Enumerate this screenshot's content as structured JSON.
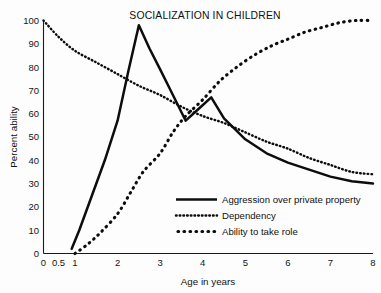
{
  "chart_data": {
    "type": "line",
    "title": "SOCIALIZATION IN CHILDREN",
    "xlabel": "Age in years",
    "ylabel": "Percent ability",
    "xlim": [
      0,
      8
    ],
    "ylim": [
      0,
      100
    ],
    "grid": false,
    "legend_position": "inside lower-right",
    "x_tick_labels": [
      "0",
      "0.5",
      "1",
      "2",
      "3",
      "4",
      "5",
      "6",
      "7",
      "8"
    ],
    "x_tick_values": [
      0,
      0.5,
      1,
      2,
      3,
      4,
      5,
      6,
      7,
      8
    ],
    "y_tick_labels": [
      "0",
      "10",
      "20",
      "30",
      "40",
      "50",
      "60",
      "70",
      "80",
      "90",
      "100"
    ],
    "y_tick_values": [
      0,
      10,
      20,
      30,
      40,
      50,
      60,
      70,
      80,
      90,
      100
    ],
    "series": [
      {
        "name": "Aggression over private property",
        "style": "solid",
        "x": [
          0.9,
          1.1,
          1.4,
          1.7,
          2.0,
          2.25,
          2.5,
          2.75,
          3.0,
          3.3,
          3.6,
          3.9,
          4.2,
          4.5,
          5.0,
          5.5,
          6.0,
          6.5,
          7.0,
          7.5,
          8.0
        ],
        "values": [
          2,
          10,
          25,
          40,
          57,
          78,
          98,
          88,
          79,
          68,
          57,
          62,
          67,
          58,
          49,
          43,
          39,
          36,
          33,
          31,
          30
        ]
      },
      {
        "name": "Dependency",
        "style": "fine-dotted",
        "x": [
          0,
          0.5,
          1.0,
          1.5,
          2.0,
          2.5,
          3.0,
          3.5,
          4.0,
          4.5,
          5.0,
          5.5,
          6.0,
          6.5,
          7.0,
          7.5,
          8.0
        ],
        "values": [
          100,
          93,
          87,
          82,
          77,
          72,
          68,
          63,
          59,
          56,
          52,
          48,
          45,
          41,
          38,
          35,
          34
        ]
      },
      {
        "name": "Ability to take role",
        "style": "coarse-dotted",
        "x": [
          1.0,
          1.3,
          1.6,
          2.0,
          2.3,
          2.6,
          3.0,
          3.3,
          3.6,
          4.0,
          4.4,
          4.8,
          5.2,
          5.6,
          6.0,
          6.4,
          6.8,
          7.2,
          7.6,
          8.0
        ],
        "values": [
          0,
          4,
          9,
          17,
          26,
          35,
          43,
          52,
          59,
          66,
          74,
          80,
          85,
          89,
          92,
          95,
          97,
          99,
          100,
          100
        ]
      }
    ]
  }
}
